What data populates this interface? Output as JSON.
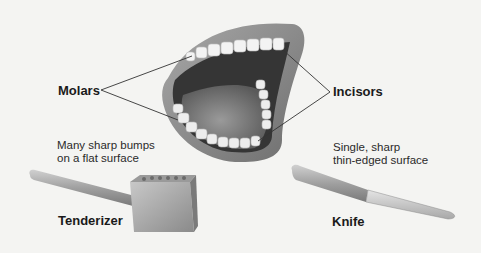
{
  "diagram": {
    "labels": {
      "molars": "Molars",
      "incisors": "Incisors",
      "tenderizer": "Tenderizer",
      "knife": "Knife"
    },
    "descriptions": {
      "tenderizer": "Many sharp bumps\non a flat surface",
      "knife": "Single, sharp\nthin-edged surface"
    },
    "colors": {
      "background": "#f4f4f2",
      "lips": "#8c8c8c",
      "mouth_interior": "#3a3a3a",
      "tongue": "#7a7a7a",
      "teeth": "#f2f2f2",
      "metal": "#b0b0b0",
      "label_text": "#1a1a1a",
      "leader_line": "#333333"
    }
  }
}
